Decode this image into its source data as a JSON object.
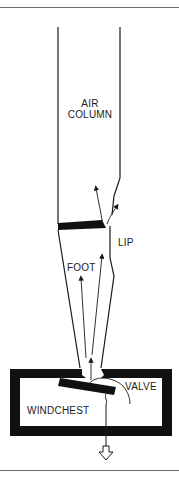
{
  "diagram": {
    "labels": {
      "air_column_line1": "AIR",
      "air_column_line2": "COLUMN",
      "lip": "LIP",
      "foot": "FOOT",
      "valve": "VALVE",
      "windchest": "WINDCHEST"
    },
    "colors": {
      "ink": "#1a1a1a",
      "rule": "#6a6a6a",
      "background": "#ffffff"
    },
    "elements": [
      "pipe-body-air-column",
      "lip-wedge",
      "pipe-foot",
      "airflow-arrows",
      "windchest-box",
      "pallet-valve",
      "pull-rod",
      "pull-direction-arrow"
    ]
  }
}
